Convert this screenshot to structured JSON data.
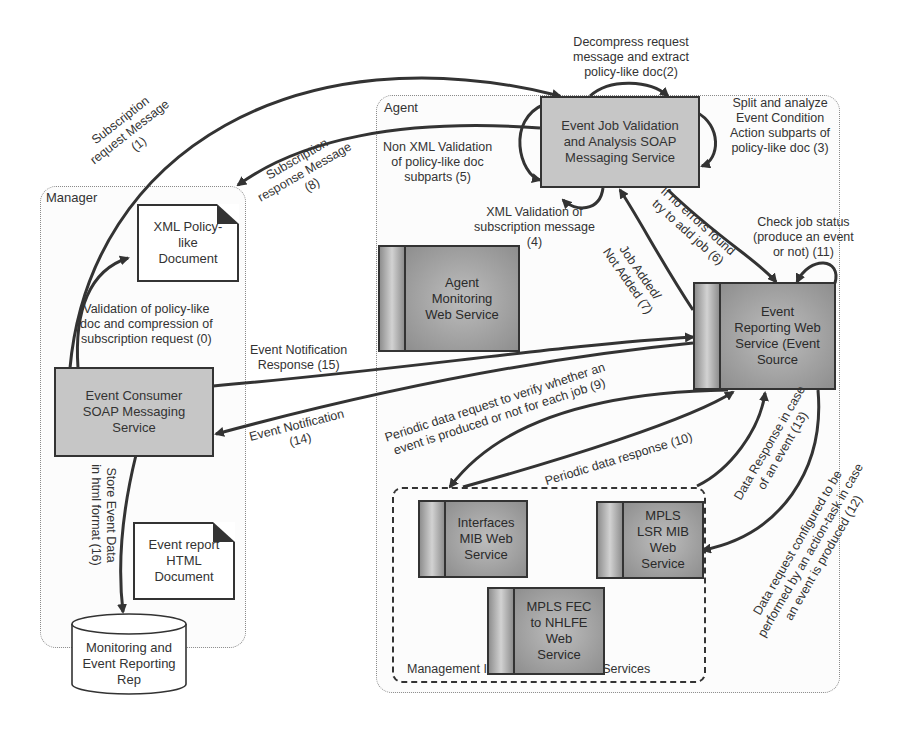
{
  "containers": {
    "manager": {
      "label": "Manager"
    },
    "agent": {
      "label": "Agent"
    },
    "mirs": {
      "label": "Management Information Retrieval Services"
    }
  },
  "nodes": {
    "event_job_validation": "Event Job Validation and Analysis SOAP Messaging Service",
    "event_job_validation_lines": [
      "Event Job Validation",
      "and Analysis SOAP",
      "Messaging Service"
    ],
    "xml_policy_doc_lines": [
      "XML Policy-",
      "like",
      "Document"
    ],
    "event_consumer_lines": [
      "Event Consumer",
      "SOAP Messaging",
      "Service"
    ],
    "event_report_doc_lines": [
      "Event report",
      "HTML",
      "Document"
    ],
    "repository_lines": [
      "Monitoring and",
      "Event Reporting",
      "Rep"
    ],
    "agent_monitoring_lines": [
      "Agent",
      "Monitoring",
      "Web Service"
    ],
    "event_reporting_lines": [
      "Event",
      "Reporting Web",
      "Service (Event",
      "Source"
    ],
    "interfaces_mib_lines": [
      "Interfaces",
      "MIB Web",
      "Service"
    ],
    "mpls_lsr_lines": [
      "MPLS",
      "LSR MIB",
      "Web",
      "Service"
    ],
    "mpls_fec_lines": [
      "MPLS FEC",
      "to NHLFE",
      "Web",
      "Service"
    ]
  },
  "edges": [
    {
      "id": 0,
      "label_lines": [
        "Validation  of policy-like",
        "doc and compression of",
        "subscription request (0)"
      ]
    },
    {
      "id": 1,
      "label_lines": [
        "Subscription",
        "request Message",
        "(1)"
      ]
    },
    {
      "id": 2,
      "label_lines": [
        "Decompress request",
        "message and extract",
        "policy-like doc(2)"
      ]
    },
    {
      "id": 3,
      "label_lines": [
        "Split and analyze",
        "Event Condition",
        "Action subparts of",
        "policy-like doc (3)"
      ]
    },
    {
      "id": 4,
      "label_lines": [
        "XML Validation of",
        "subscription message",
        "(4)"
      ]
    },
    {
      "id": 5,
      "label_lines": [
        "Non XML Validation",
        "of  policy-like doc",
        "subparts (5)"
      ]
    },
    {
      "id": 6,
      "label_lines": [
        "If no errors found",
        "try to add job (6)"
      ]
    },
    {
      "id": 7,
      "label_lines": [
        "Job Added/",
        "Not Added (7)"
      ]
    },
    {
      "id": 8,
      "label_lines": [
        "Subscription",
        "response Message",
        "(8)"
      ]
    },
    {
      "id": 9,
      "label_lines": [
        "Periodic data request to verify whether an",
        "event is produced or not for each job (9)"
      ]
    },
    {
      "id": 10,
      "label_lines": [
        "Periodic data response (10)"
      ]
    },
    {
      "id": 11,
      "label_lines": [
        "Check job status",
        "(produce an event",
        "or not) (11)"
      ]
    },
    {
      "id": 12,
      "label_lines": [
        "Data request configured to be",
        "performed by an action-task in case",
        "an event is produced (12)"
      ]
    },
    {
      "id": 13,
      "label_lines": [
        "Data Response  in case",
        "of an event (13)"
      ]
    },
    {
      "id": 14,
      "label_lines": [
        "Event Notification",
        "(14)"
      ]
    },
    {
      "id": 15,
      "label_lines": [
        "Event Notification",
        "Response (15)"
      ]
    },
    {
      "id": 16,
      "label_lines": [
        "Store Event Data",
        "in html format (16)"
      ]
    }
  ],
  "colors": {
    "soap_box_fill": "#c6c6c6",
    "web_service_fill": "#a8a8a8",
    "stroke": "#333333",
    "panel_border": "#8a8a8a"
  }
}
